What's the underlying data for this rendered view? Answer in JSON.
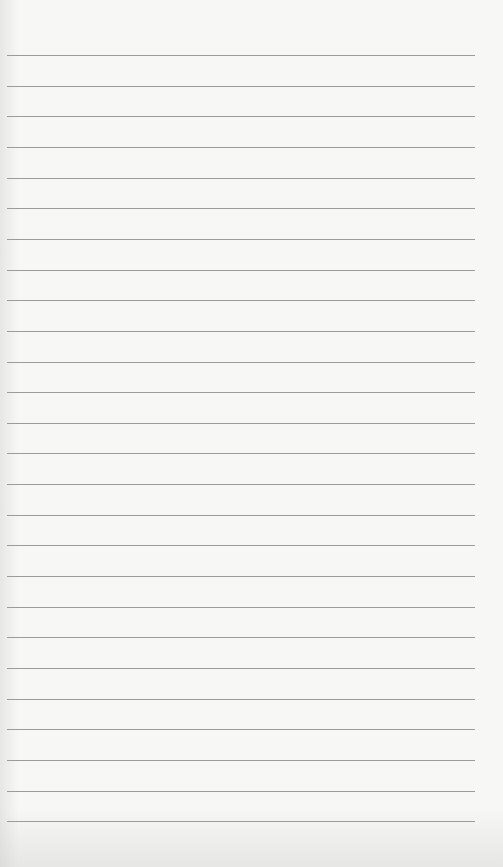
{
  "paper": {
    "background": "#f7f7f5",
    "line_color": "#9c9c9c",
    "line_count": 26,
    "first_line_y": 55,
    "line_spacing": 30.65,
    "line_left": 7,
    "line_right": 475
  }
}
